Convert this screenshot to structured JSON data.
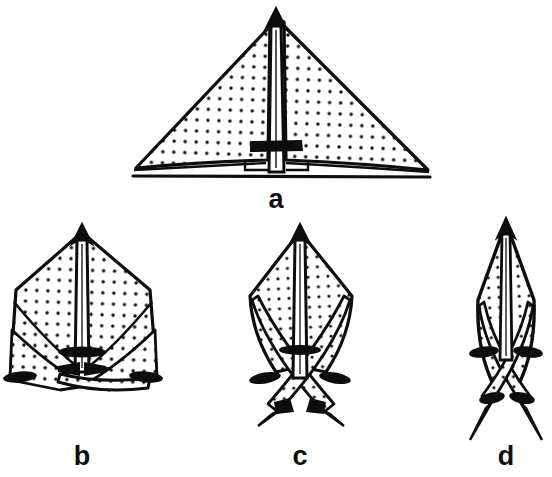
{
  "figure": {
    "background_color": "#ffffff",
    "ink_color": "#0d0d0d",
    "stipple_color": "#111111",
    "fill_color": "#ffffff",
    "panel_count": 4
  },
  "panels": [
    {
      "id": "a",
      "label": "a",
      "label_x": 276,
      "label_y": 208,
      "shape_name": "broad-triangular-lamina",
      "apex_x": 276,
      "apex_y": 12,
      "base_y": 172,
      "left_tip_x": 133,
      "right_tip_x": 430,
      "midrib_bar_y": 145,
      "stipple": true
    },
    {
      "id": "b",
      "label": "b",
      "label_x": 82,
      "label_y": 465,
      "shape_name": "broad-ovate-lamina",
      "apex_x": 82,
      "apex_y": 228,
      "base_y": 390,
      "left_tip_x": 8,
      "right_tip_x": 160,
      "midrib_bar_y": 352,
      "stipple": true
    },
    {
      "id": "c",
      "label": "c",
      "label_x": 300,
      "label_y": 465,
      "shape_name": "narrow-rhombic-lamina",
      "apex_x": 300,
      "apex_y": 228,
      "base_y": 372,
      "left_tip_x": 246,
      "right_tip_x": 354,
      "midrib_bar_y": 350,
      "stipple": true
    },
    {
      "id": "d",
      "label": "d",
      "label_x": 506,
      "label_y": 465,
      "shape_name": "linear-lanceolate-lamina",
      "apex_x": 506,
      "apex_y": 222,
      "base_y": 408,
      "left_tip_x": 470,
      "right_tip_x": 542,
      "midrib_bar_y": 352,
      "stipple": true
    }
  ],
  "caption_labels": [
    "a",
    "b",
    "c",
    "d"
  ]
}
